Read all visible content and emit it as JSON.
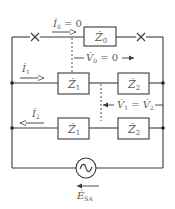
{
  "diagram": {
    "type": "circuit",
    "colors": {
      "line": "#3a3a3a",
      "text": "#5a5a5a",
      "background": "#ffffff"
    },
    "impedances": {
      "z0": {
        "symbol": "Ż",
        "sub": "0"
      },
      "row1_z1": {
        "symbol": "Ż",
        "sub": "1"
      },
      "row1_z2": {
        "symbol": "Ż",
        "sub": "2"
      },
      "row2_z1": {
        "symbol": "Ż",
        "sub": "1"
      },
      "row2_z2": {
        "symbol": "Ż",
        "sub": "2"
      }
    },
    "currents": {
      "i0": {
        "symbol": "İ",
        "sub": "0",
        "suffix": " = 0"
      },
      "i1": {
        "symbol": "İ",
        "sub": "1"
      },
      "i2": {
        "symbol": "İ",
        "sub": "2"
      }
    },
    "voltages": {
      "v0": {
        "symbol": "V̇",
        "sub": "0",
        "suffix": " = 0"
      },
      "v1": {
        "symbol": "V̇",
        "sub": "1",
        "eq": " = ",
        "symbol2": "V̇",
        "sub2": "2"
      }
    },
    "source": {
      "symbol": "Ė",
      "sub": "SA",
      "glyph": "~"
    },
    "switches": [
      {
        "name": "open-left",
        "glyph": "×"
      },
      {
        "name": "open-right",
        "glyph": "×"
      }
    ]
  }
}
